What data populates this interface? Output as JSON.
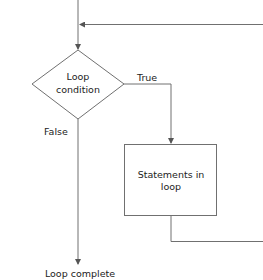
{
  "diagram": {
    "type": "flowchart",
    "title": "",
    "colors": {
      "line": "#707070",
      "text": "#222222",
      "background": "#ffffff"
    },
    "nodes": [
      {
        "id": "condition",
        "shape": "diamond",
        "line1": "Loop",
        "line2": "condition"
      },
      {
        "id": "body",
        "shape": "rectangle",
        "line1": "Statements in",
        "line2": "loop"
      },
      {
        "id": "end",
        "shape": "terminal-text",
        "label": "Loop complete"
      }
    ],
    "edges": [
      {
        "from": "entry",
        "to": "condition",
        "label": ""
      },
      {
        "from": "condition",
        "to": "body",
        "label": "True"
      },
      {
        "from": "condition",
        "to": "end",
        "label": "False"
      },
      {
        "from": "body",
        "to": "condition",
        "label": ""
      }
    ]
  },
  "labels": {
    "true": "True",
    "false": "False",
    "condition_line1": "Loop",
    "condition_line2": "condition",
    "body_line1": "Statements in",
    "body_line2": "loop",
    "end": "Loop complete"
  }
}
